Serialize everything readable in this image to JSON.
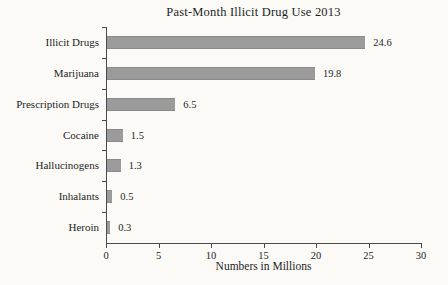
{
  "figure": {
    "background": "#fbfaf7"
  },
  "chart_data": {
    "type": "bar",
    "orientation": "horizontal",
    "title": "Past-Month Illicit Drug Use 2013",
    "categories": [
      "Illicit Drugs",
      "Marijuana",
      "Prescription Drugs",
      "Cocaine",
      "Hallucinogens",
      "Inhalants",
      "Heroin"
    ],
    "values": [
      24.6,
      19.8,
      6.5,
      1.5,
      1.3,
      0.5,
      0.3
    ],
    "value_labels": [
      "24.6",
      "19.8",
      "6.5",
      "1.5",
      "1.3",
      "0.5",
      "0.3"
    ],
    "xlabel": "Numbers in Millions",
    "ylabel": "",
    "xlim": [
      0,
      30
    ],
    "x_ticks": [
      0,
      5,
      10,
      15,
      20,
      25,
      30
    ],
    "grid": false,
    "legend": null,
    "bar_color": "#9b9b9b",
    "axis_color": "#4a4a4a",
    "text_color": "#1e1e1e"
  }
}
